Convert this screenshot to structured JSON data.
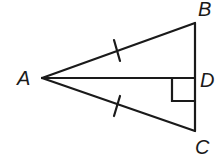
{
  "diagram": {
    "type": "geometry",
    "points": {
      "A": {
        "label": "A",
        "x": 42,
        "y": 78
      },
      "B": {
        "label": "B",
        "x": 195,
        "y": 23
      },
      "C": {
        "label": "C",
        "x": 195,
        "y": 131
      },
      "D": {
        "label": "D",
        "x": 195,
        "y": 78
      }
    },
    "segments": [
      "AB",
      "AC",
      "AD",
      "BC"
    ],
    "congruent_marks": [
      "AB",
      "AC"
    ],
    "right_angle_at": "D",
    "colors": {
      "stroke": "#1a1a1a",
      "background": "#ffffff"
    }
  }
}
